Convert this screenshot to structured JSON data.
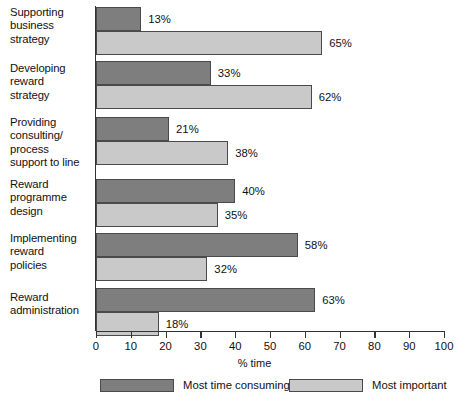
{
  "chart_data": {
    "type": "bar",
    "orientation": "horizontal",
    "title": "",
    "xlabel": "% time",
    "ylabel": "",
    "xlim": [
      0,
      100
    ],
    "xticks": [
      0,
      10,
      20,
      30,
      40,
      50,
      60,
      70,
      80,
      90,
      100
    ],
    "xtick_labels": [
      "0",
      "10",
      "20",
      "30",
      "40",
      "50",
      "60",
      "70",
      "80",
      "90",
      "100"
    ],
    "grid": false,
    "legend_position": "bottom",
    "value_suffix": "%",
    "categories": [
      "Supporting business strategy",
      "Developing reward strategy",
      "Providing consulting/ process support to line",
      "Reward programme design",
      "Implementing reward policies",
      "Reward administration"
    ],
    "category_lines": [
      [
        "Supporting",
        "business",
        "strategy"
      ],
      [
        "Developing",
        "reward",
        "strategy"
      ],
      [
        "Providing",
        "consulting/",
        "process",
        "support to line"
      ],
      [
        "Reward",
        "programme",
        "design"
      ],
      [
        "Implementing",
        "reward",
        "policies"
      ],
      [
        "Reward",
        "administration"
      ]
    ],
    "series": [
      {
        "name": "Most time consuming",
        "color": "#7e7e7e",
        "values": [
          13,
          33,
          21,
          40,
          58,
          63
        ],
        "labels": [
          "13%",
          "33%",
          "21%",
          "40%",
          "58%",
          "63%"
        ]
      },
      {
        "name": "Most important",
        "color": "#c9c9c9",
        "values": [
          65,
          62,
          38,
          35,
          32,
          18
        ],
        "labels": [
          "65%",
          "62%",
          "38%",
          "35%",
          "32%",
          "18%"
        ]
      }
    ]
  },
  "legend": {
    "items": [
      {
        "label": "Most time consuming",
        "swatch": "dark"
      },
      {
        "label": "Most important",
        "swatch": "light"
      }
    ]
  },
  "axis": {
    "x_title": "% time"
  }
}
